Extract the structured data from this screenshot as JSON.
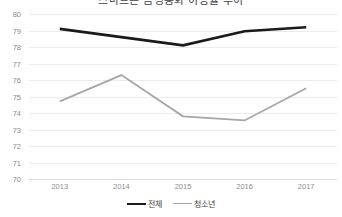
{
  "chart_data": {
    "type": "line",
    "title": "스마트폰 음성통화 이용률 추이",
    "xlabel": "",
    "ylabel": "",
    "categories": [
      "2013",
      "2014",
      "2015",
      "2016",
      "2017"
    ],
    "x_tick_labels": [
      "2013",
      "2014",
      "2015",
      "2016",
      "2017"
    ],
    "y_tick_labels": [
      "80",
      "79",
      "78",
      "77",
      "76",
      "75",
      "74",
      "73",
      "72",
      "71",
      "70"
    ],
    "y_ticks": [
      80,
      79,
      78,
      77,
      76,
      75,
      74,
      73,
      72,
      71,
      70
    ],
    "ylim": [
      70,
      80
    ],
    "grid": true,
    "legend_position": "bottom",
    "series": [
      {
        "name": "전체",
        "color": "#1a1a1a",
        "width": 2.6,
        "values": [
          79.1,
          78.6,
          78.1,
          78.95,
          79.2
        ]
      },
      {
        "name": "청소년",
        "color": "#a6a6a6",
        "width": 1.8,
        "values": [
          74.7,
          76.3,
          73.8,
          73.55,
          75.5
        ]
      }
    ]
  },
  "legend": {
    "items": [
      {
        "label": "전체",
        "key": "total"
      },
      {
        "label": "청소년",
        "key": "youth"
      }
    ]
  },
  "colors": {
    "total_series": "#1a1a1a",
    "youth_series": "#a6a6a6",
    "gridline": "#ececed",
    "tick_text": "#8b8b8b"
  }
}
